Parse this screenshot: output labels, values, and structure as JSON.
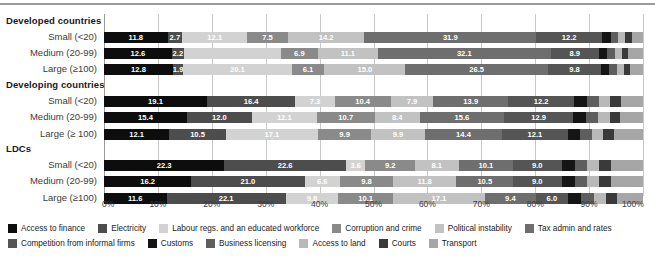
{
  "chart_data": {
    "type": "bar",
    "orientation": "horizontal",
    "stacked": true,
    "normalized": "100%",
    "title": "",
    "xlabel": "",
    "ylabel": "",
    "xlim": [
      0,
      100
    ],
    "grid": true,
    "legend_position": "bottom",
    "xticks": [
      "0%",
      "10%",
      "20%",
      "30%",
      "40%",
      "50%",
      "60%",
      "70%",
      "80%",
      "90%",
      "100%"
    ],
    "xtick_values": [
      0,
      10,
      20,
      30,
      40,
      50,
      60,
      70,
      80,
      90,
      100
    ],
    "groups": [
      {
        "name": "Developed countries",
        "categories": [
          "Small (<20)",
          "Medium (20-99)",
          "Large (≥100)"
        ]
      },
      {
        "name": "Developing countries",
        "categories": [
          "Small (<20)",
          "Medium (20-99)",
          "Large (≥ 100)"
        ]
      },
      {
        "name": "LDCs",
        "categories": [
          "Small (<20)",
          "Medium (20-99)",
          "Large (≥100)"
        ]
      }
    ],
    "series": [
      {
        "name": "Access to finance",
        "color": "#0d0d0d"
      },
      {
        "name": "Electricity",
        "color": "#4d4d4d"
      },
      {
        "name": "Labour regs. and an educated workforce",
        "color": "#d2d2d2"
      },
      {
        "name": "Corruption and crime",
        "color": "#8a8a8a"
      },
      {
        "name": "Political instability",
        "color": "#c2c2c2"
      },
      {
        "name": "Tax admin and rates",
        "color": "#6e6e6e"
      },
      {
        "name": "Competition from informal firms",
        "color": "#555555"
      },
      {
        "name": "Customs",
        "color": "#151515"
      },
      {
        "name": "Business licensing",
        "color": "#5e5e5e"
      },
      {
        "name": "Access to land",
        "color": "#b9b9b9"
      },
      {
        "name": "Courts",
        "color": "#3a3a3a"
      },
      {
        "name": "Transport",
        "color": "#a6a6a6"
      }
    ],
    "bars": [
      {
        "group": "Developed countries",
        "category": "Small (<20)",
        "values": [
          11.8,
          2.7,
          12.1,
          7.5,
          14.2,
          31.9,
          12.2,
          1.6,
          1.4,
          1.3,
          1.2,
          2.1
        ],
        "labels": [
          "11.8",
          "2.7",
          "12.1",
          "7.5",
          "14.2",
          "31.9",
          "12.2",
          "",
          "",
          "",
          "",
          ""
        ]
      },
      {
        "group": "Developed countries",
        "category": "Medium (20-99)",
        "values": [
          12.6,
          2.2,
          18.0,
          6.9,
          11.1,
          32.1,
          8.9,
          1.6,
          1.4,
          1.3,
          1.2,
          2.7
        ],
        "labels": [
          "12.6",
          "2.2",
          "",
          "6.9",
          "11.1",
          "32.1",
          "8.9",
          "",
          "",
          "",
          "",
          ""
        ]
      },
      {
        "group": "Developed countries",
        "category": "Large (≥100)",
        "values": [
          12.8,
          1.9,
          20.1,
          6.1,
          15.0,
          26.5,
          9.8,
          1.5,
          1.4,
          1.3,
          1.2,
          2.4
        ],
        "labels": [
          "12.8",
          "1.9",
          "20.1",
          "6.1",
          "15.0",
          "26.5",
          "9.8",
          "",
          "",
          "",
          "",
          ""
        ]
      },
      {
        "group": "Developing countries",
        "category": "Small (<20)",
        "values": [
          19.1,
          16.4,
          7.3,
          10.4,
          7.9,
          13.9,
          12.2,
          2.4,
          2.2,
          2.1,
          2.0,
          4.1
        ],
        "labels": [
          "19.1",
          "16.4",
          "7.3",
          "10.4",
          "7.9",
          "13.9",
          "12.2",
          "",
          "",
          "",
          "",
          ""
        ]
      },
      {
        "group": "Developing countries",
        "category": "Medium (20-99)",
        "values": [
          15.4,
          12.0,
          12.1,
          10.7,
          8.4,
          15.6,
          12.9,
          2.4,
          2.2,
          2.1,
          2.0,
          4.2
        ],
        "labels": [
          "15.4",
          "12.0",
          "12.1",
          "10.7",
          "8.4",
          "15.6",
          "12.9",
          "",
          "",
          "",
          "",
          ""
        ]
      },
      {
        "group": "Developing countries",
        "category": "Large (≥ 100)",
        "values": [
          12.1,
          10.5,
          17.1,
          9.9,
          9.9,
          14.4,
          12.1,
          2.3,
          2.2,
          2.1,
          2.0,
          5.4
        ],
        "labels": [
          "12.1",
          "10.5",
          "17.1",
          "9.9",
          "9.9",
          "14.4",
          "12.1",
          "",
          "",
          "",
          "",
          ""
        ]
      },
      {
        "group": "LDCs",
        "category": "Small (<20)",
        "values": [
          22.3,
          22.6,
          3.6,
          9.2,
          8.1,
          10.1,
          9.0,
          2.5,
          2.3,
          2.2,
          2.1,
          6.0
        ],
        "labels": [
          "22.3",
          "22.6",
          "3.6",
          "9.2",
          "8.1",
          "10.1",
          "9.0",
          "",
          "",
          "",
          "",
          ""
        ]
      },
      {
        "group": "LDCs",
        "category": "Medium (20-99)",
        "values": [
          16.2,
          21.0,
          6.6,
          9.8,
          11.8,
          10.5,
          9.0,
          2.5,
          2.3,
          2.2,
          2.1,
          6.0
        ],
        "labels": [
          "16.2",
          "21.0",
          "6.6",
          "9.8",
          "11.8",
          "10.5",
          "9.0",
          "",
          "",
          "",
          "",
          ""
        ]
      },
      {
        "group": "LDCs",
        "category": "Large (≥100)",
        "values": [
          11.6,
          22.1,
          9.8,
          10.1,
          17.1,
          9.4,
          6.0,
          2.5,
          2.3,
          2.2,
          2.1,
          4.8
        ],
        "labels": [
          "11.6",
          "22.1",
          "9.8",
          "10.1",
          "17.1",
          "9.4",
          "6.0",
          "",
          "",
          "",
          "",
          ""
        ]
      }
    ]
  },
  "legend": {
    "row1": [
      {
        "label": "Access to finance",
        "color": "#0d0d0d",
        "icon": "legend-swatch"
      },
      {
        "label": "Electricity",
        "color": "#4d4d4d",
        "icon": "legend-swatch"
      },
      {
        "label": "Labour regs. and an educated workforce",
        "color": "#d2d2d2",
        "icon": "legend-swatch"
      },
      {
        "label": "Corruption and crime",
        "color": "#8a8a8a",
        "icon": "legend-swatch"
      },
      {
        "label": "Political instability",
        "color": "#c2c2c2",
        "icon": "legend-swatch"
      },
      {
        "label": "Tax admin and rates",
        "color": "#6e6e6e",
        "icon": "legend-swatch"
      }
    ],
    "row2": [
      {
        "label": "Competition from informal firms",
        "color": "#555555",
        "icon": "legend-swatch"
      },
      {
        "label": "Customs",
        "color": "#151515",
        "icon": "legend-swatch"
      },
      {
        "label": "Business licensing",
        "color": "#5e5e5e",
        "icon": "legend-swatch"
      },
      {
        "label": "Access to land",
        "color": "#b9b9b9",
        "icon": "legend-swatch"
      },
      {
        "label": "Courts",
        "color": "#3a3a3a",
        "icon": "legend-swatch"
      },
      {
        "label": "Transport",
        "color": "#a6a6a6",
        "icon": "legend-swatch"
      }
    ]
  }
}
